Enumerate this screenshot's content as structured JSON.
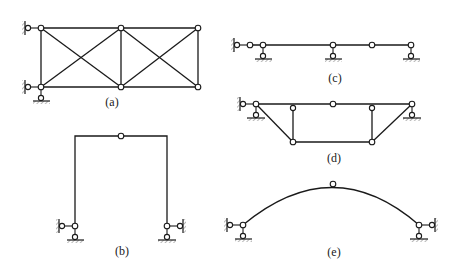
{
  "figures": [
    {
      "id": "a",
      "label": "(a)",
      "type": "truss-two-panel-cross-braced",
      "supports": [
        "left-top horizontal link",
        "left-bottom horizontal link",
        "left-bottom vertical link"
      ]
    },
    {
      "id": "b",
      "label": "(b)",
      "type": "three-hinged-portal-frame",
      "supports": [
        "left horizontal link",
        "left vertical link",
        "right horizontal link",
        "right vertical link"
      ]
    },
    {
      "id": "c",
      "label": "(c)",
      "type": "multi-span-beam-with-hinge",
      "supports": [
        "left horizontal link",
        "vertical link",
        "vertical link",
        "vertical link"
      ]
    },
    {
      "id": "d",
      "label": "(d)",
      "type": "trussed-beam",
      "supports": [
        "left horizontal link",
        "left vertical link",
        "right vertical link"
      ]
    },
    {
      "id": "e",
      "label": "(e)",
      "type": "three-hinged-arch",
      "supports": [
        "left horizontal link",
        "left vertical link",
        "right horizontal link",
        "right vertical link"
      ]
    }
  ],
  "colors": {
    "line": "#1a1a1a",
    "background": "#ffffff"
  }
}
